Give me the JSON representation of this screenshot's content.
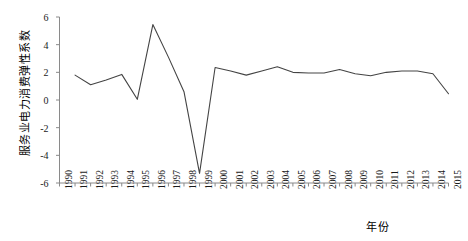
{
  "chart_data": {
    "type": "line",
    "title": "",
    "xlabel": "年份",
    "ylabel": "服务业电力消费弹性系数",
    "x": [
      1990,
      1991,
      1992,
      1993,
      1994,
      1995,
      1996,
      1997,
      1998,
      1999,
      2000,
      2001,
      2002,
      2003,
      2004,
      2005,
      2006,
      2007,
      2008,
      2009,
      2010,
      2011,
      2012,
      2013,
      2014,
      2015
    ],
    "categories": [
      "1990",
      "1991",
      "1992",
      "1993",
      "1994",
      "1995",
      "1996",
      "1997",
      "1998",
      "1999",
      "2000",
      "2001",
      "2002",
      "2003",
      "2004",
      "2005",
      "2006",
      "2007",
      "2008",
      "2009",
      "2010",
      "2011",
      "2012",
      "2013",
      "2014",
      "2015"
    ],
    "values": [
      null,
      1.8,
      1.1,
      1.45,
      1.85,
      0.05,
      5.45,
      3.1,
      0.6,
      -5.3,
      2.35,
      2.1,
      1.8,
      2.1,
      2.4,
      2.0,
      1.95,
      1.95,
      2.2,
      1.9,
      1.75,
      2.0,
      2.1,
      2.1,
      1.9,
      0.45
    ],
    "series": [
      {
        "name": "服务业电力消费弹性系数",
        "values": [
          null,
          1.8,
          1.1,
          1.45,
          1.85,
          0.05,
          5.45,
          3.1,
          0.6,
          -5.3,
          2.35,
          2.1,
          1.8,
          2.1,
          2.4,
          2.0,
          1.95,
          1.95,
          2.2,
          1.9,
          1.75,
          2.0,
          2.1,
          2.1,
          1.9,
          0.45
        ],
        "color": "#444444"
      }
    ],
    "ytick_labels": [
      "6",
      "4",
      "2",
      "0",
      "-2",
      "-4",
      "-6"
    ],
    "ytick_values": [
      6,
      4,
      2,
      0,
      -2,
      -4,
      -6
    ],
    "ylim": [
      -6,
      6
    ],
    "xlim": [
      1990,
      2015
    ],
    "grid": false,
    "legend": false,
    "line_color": "#444444",
    "axis_color": "#888888",
    "background": "#ffffff"
  },
  "figure": {
    "axis_line_color": "#8a8a8a",
    "tick_color": "#8a8a8a"
  }
}
